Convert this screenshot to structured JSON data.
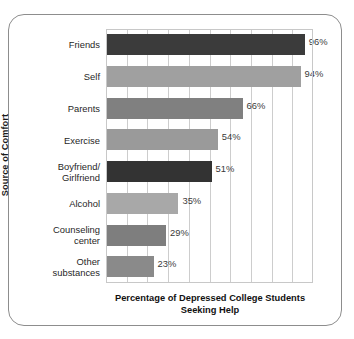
{
  "chart_data": {
    "type": "bar",
    "orientation": "horizontal",
    "title": "",
    "xlabel": "Percentage of Depressed College Students Seeking Help",
    "xlabel_line1": "Percentage of Depressed College Students",
    "xlabel_line2": "Seeking Help",
    "ylabel": "Source of Comfort",
    "categories": [
      "Friends",
      "Self",
      "Parents",
      "Exercise",
      "Boyfriend/ Girlfriend",
      "Alcohol",
      "Counseling center",
      "Other substances"
    ],
    "category_lines": [
      [
        "Friends"
      ],
      [
        "Self"
      ],
      [
        "Parents"
      ],
      [
        "Exercise"
      ],
      [
        "Boyfriend/",
        "Girlfriend"
      ],
      [
        "Alcohol"
      ],
      [
        "Counseling",
        "center"
      ],
      [
        "Other",
        "substances"
      ]
    ],
    "values": [
      96,
      94,
      66,
      54,
      51,
      35,
      29,
      23
    ],
    "data_labels": [
      "96%",
      "94%",
      "66%",
      "54%",
      "51%",
      "35%",
      "29%",
      "23%"
    ],
    "bar_colors": [
      "#3b3b3b",
      "#a0a0a0",
      "#808080",
      "#9a9a9a",
      "#333333",
      "#a8a8a8",
      "#7e7e7e",
      "#8a8a8a"
    ],
    "xlim": [
      0,
      100
    ],
    "xticks": [
      0,
      10,
      20,
      30,
      40,
      50,
      60,
      70,
      80,
      90,
      100
    ],
    "xtick_labels": [
      "",
      "",
      "",
      "",
      "",
      "",
      "",
      "",
      "",
      "",
      ""
    ],
    "grid": true,
    "grid_axis": "x",
    "grid_color": "#cdcdcd",
    "legend": "none",
    "frame_color": "#8d8d8d",
    "plot_border_color": "#c8c8c8",
    "background": "#ffffff"
  }
}
